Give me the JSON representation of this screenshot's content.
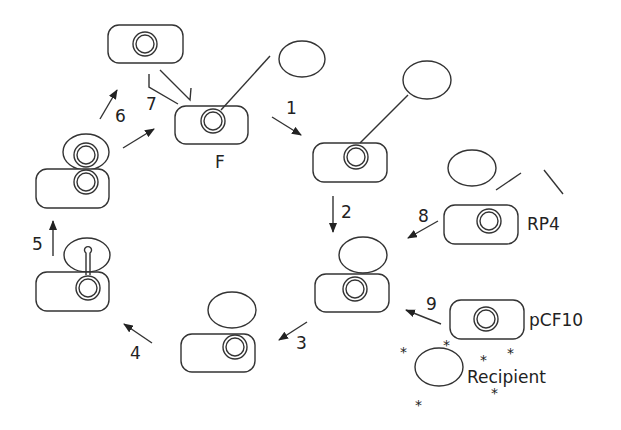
{
  "diagram": {
    "type": "plasmid conjugation cycle",
    "step_labels": [
      "1",
      "2",
      "3",
      "4",
      "5",
      "6",
      "7",
      "8",
      "9"
    ],
    "plasmid_labels": {
      "f": "F",
      "rp4": "RP4",
      "pcf10": "pCF10"
    },
    "recipient_label": "Recipient",
    "star_symbol": "*",
    "colors": {
      "line": "#333333",
      "background": "#ffffff"
    }
  }
}
